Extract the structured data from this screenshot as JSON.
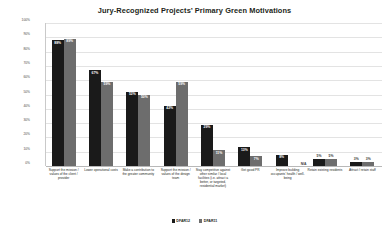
{
  "chart_data": {
    "type": "bar",
    "title": "Jury-Recognized Projects’ Primary Green Motivations",
    "xlabel": "",
    "ylabel": "Percentage of Submissions",
    "ylim": [
      0,
      100
    ],
    "grid": true,
    "legend_position": "bottom",
    "ytick_labels": [
      "100%",
      "90%",
      "80%",
      "70%",
      "60%",
      "50%",
      "40%",
      "30%",
      "20%",
      "10%",
      "0%"
    ],
    "categories": [
      "Support the mission / values of the client / provider",
      "Lower operational costs",
      "Make a contribution to the greater community",
      "Support the mission / values of the design team",
      "Stay competitive against other similar / local facilities (i.e. attract a better, or targeted, residential market)",
      "Get good PR",
      "Improve building occupants’ health / well-being",
      "Retain existing residents",
      "Attract / retain staff"
    ],
    "series": [
      {
        "name": "DFAR12",
        "color": "#1a1a1a",
        "values": [
          88,
          67,
          52,
          42,
          29,
          13,
          8,
          5,
          3
        ],
        "labels": [
          "88%",
          "67%",
          "52%",
          "42%",
          "29%",
          "13%",
          "8%",
          "5%",
          "3%"
        ]
      },
      {
        "name": "DFAR11",
        "color": "#6d6d6d",
        "values": [
          89,
          59,
          50,
          59,
          11,
          7,
          null,
          5,
          3
        ],
        "labels": [
          "89%",
          "59%",
          "50%",
          "59%",
          "11%",
          "7%",
          "N/A",
          "5%",
          "3%"
        ]
      }
    ]
  }
}
